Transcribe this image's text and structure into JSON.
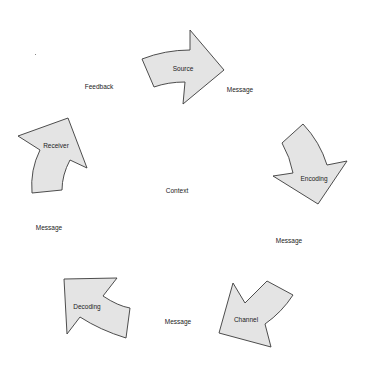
{
  "diagram": {
    "type": "communication-cycle",
    "center_label": "Context",
    "colors": {
      "arrow_fill": "#e4e4e4",
      "arrow_stroke": "#3a3a3a",
      "text": "#222222",
      "background": "#ffffff"
    },
    "stages": [
      {
        "id": "source",
        "label": "Source"
      },
      {
        "id": "encoding",
        "label": "Encoding"
      },
      {
        "id": "channel",
        "label": "Channel"
      },
      {
        "id": "decoding",
        "label": "Decoding"
      },
      {
        "id": "receiver",
        "label": "Receiver"
      }
    ],
    "connectors": [
      {
        "from": "source",
        "to": "encoding",
        "label": "Message"
      },
      {
        "from": "encoding",
        "to": "channel",
        "label": "Message"
      },
      {
        "from": "channel",
        "to": "decoding",
        "label": "Message"
      },
      {
        "from": "decoding",
        "to": "receiver",
        "label": "Message"
      },
      {
        "from": "receiver",
        "to": "source",
        "label": "Feedback"
      }
    ]
  }
}
